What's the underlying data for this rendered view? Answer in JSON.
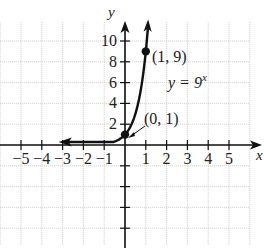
{
  "chart_data": {
    "type": "line",
    "title": "",
    "xlabel": "x",
    "ylabel": "y",
    "xlim": [
      -6,
      6
    ],
    "ylim": [
      -10.5,
      11
    ],
    "grid": true,
    "x_ticks": [
      -5,
      -4,
      -3,
      -2,
      -1,
      1,
      2,
      3,
      4,
      5
    ],
    "x_tick_labels": [
      "−5",
      "−4",
      "−3",
      "−2",
      "−1",
      "1",
      "2",
      "3",
      "4",
      "5"
    ],
    "y_ticks": [
      2,
      4,
      6,
      8,
      10,
      -2,
      -4,
      -6,
      -8
    ],
    "y_tick_labels": [
      "2",
      "4",
      "6",
      "8",
      "10"
    ],
    "series": [
      {
        "name": "y = 9^x",
        "function": "9^x",
        "x": [
          -3,
          -2.5,
          -2,
          -1.5,
          -1,
          -0.5,
          0,
          0.25,
          0.5,
          0.75,
          1,
          1.1
        ],
        "values": [
          0.0014,
          0.0041,
          0.0123,
          0.037,
          0.111,
          0.333,
          1,
          1.73,
          3,
          5.2,
          9,
          11.2
        ]
      }
    ],
    "points": [
      {
        "x": 0,
        "y": 1,
        "label": "(0, 1)"
      },
      {
        "x": 1,
        "y": 9,
        "label": "(1, 9)"
      }
    ],
    "annotations": [
      {
        "text": "y = 9",
        "superscript": "x",
        "near": [
          2.2,
          6
        ]
      },
      {
        "text": "(1, 9)",
        "near": [
          1,
          9
        ]
      },
      {
        "text": "(0, 1)",
        "near": [
          0,
          1
        ],
        "arrow": true
      }
    ],
    "legend": null
  },
  "labels": {
    "x_axis": "x",
    "y_axis": "y",
    "equation_main": "y = 9",
    "equation_sup": "x",
    "point_a": "(1, 9)",
    "point_b": "(0, 1)"
  }
}
